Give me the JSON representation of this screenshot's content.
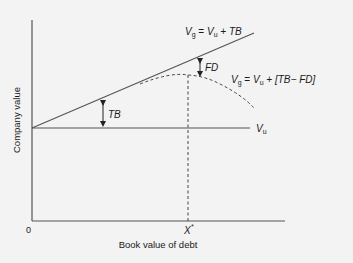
{
  "diagram": {
    "axis_x_label": "Book value of debt",
    "axis_y_label": "Company value",
    "origin_label": "0",
    "optimum_label": "X",
    "optimum_superscript": "*",
    "line_levered": {
      "V": "V",
      "g": "g",
      "eq": " = ",
      "Vu": "V",
      "u": "u",
      "rest": " + TB"
    },
    "line_levered_fd": {
      "V": "V",
      "g": "g",
      "eq": " = ",
      "Vu": "V",
      "u": "u",
      "rest": " + [TB− FD]"
    },
    "line_unlevered": {
      "V": "V",
      "u": "u"
    },
    "gap_tb_label": "TB",
    "gap_fd_label": "FD"
  },
  "colors": {
    "line": "#555555",
    "text": "#1a1a1a",
    "background": "#f3f3f3"
  }
}
